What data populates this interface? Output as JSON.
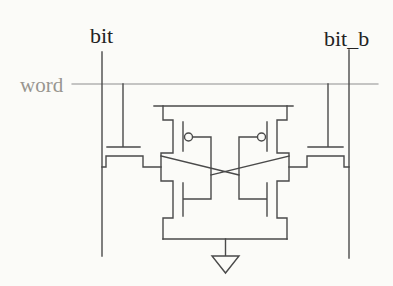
{
  "diagram": {
    "type": "circuit-schematic",
    "labels": {
      "bit": "bit",
      "bit_b": "bit_b",
      "word": "word"
    },
    "colors": {
      "background": "#fbfbf8",
      "line": "#4a4a4a",
      "word_line": "#8d8d8d",
      "label_dark": "#232323",
      "label_gray": "#98958f"
    },
    "components": [
      "bit-line",
      "bit-b-line",
      "word-line",
      "left-access-transistor",
      "right-access-transistor",
      "left-inverter-pmos",
      "left-inverter-nmos",
      "right-inverter-pmos",
      "right-inverter-nmos",
      "cross-coupling-wires",
      "supply-rail",
      "ground-symbol"
    ]
  }
}
